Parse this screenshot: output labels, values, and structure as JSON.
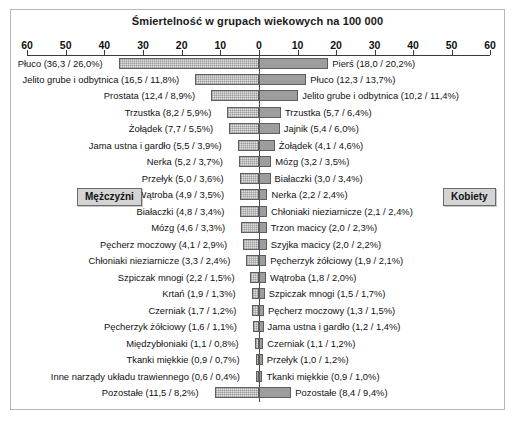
{
  "chart": {
    "title": "Śmiertelność w grupach wiekowych na 100 000",
    "legend_men": "Mężczyźni",
    "legend_women": "Kobiety",
    "colors": {
      "bar_men_fill": "#e2e2e2",
      "bar_women_fill": "#9d9d9d",
      "bar_border": "#5d5d5d",
      "frame_border": "#b8b8b8",
      "axis": "#3a3a3a",
      "legend_bg": "#d4d4d4",
      "text": "#111111"
    }
  },
  "chart_data": {
    "type": "bar",
    "title": "Śmiertelność w grupach wiekowych na 100 000",
    "subtitle": "",
    "xlabel": "",
    "ylabel": "",
    "orientation": "horizontal",
    "layout": "diverging-bidirectional-pyramid",
    "grid": false,
    "legend_position": "inside-middle-left-and-right",
    "axis": {
      "left_ticks": [
        60,
        50,
        40,
        30,
        20,
        10,
        0
      ],
      "right_ticks": [
        0,
        10,
        20,
        30,
        40,
        50,
        60
      ],
      "tick_labels_left": [
        "60",
        "50",
        "40",
        "30",
        "20",
        "10",
        "0"
      ],
      "tick_labels_right": [
        "0",
        "10",
        "20",
        "30",
        "40",
        "50",
        "60"
      ],
      "xlim_left": [
        0,
        60
      ],
      "xlim_right": [
        0,
        60
      ],
      "center_value": 0
    },
    "series": [
      {
        "name": "Mężczyźni",
        "side": "left",
        "value_unit": "rate per 100 000",
        "items": [
          {
            "label": "Płuco",
            "value": 36.3,
            "percent": 26.0,
            "text": "Płuco (36,3 / 26,0%)"
          },
          {
            "label": "Jelito grube i odbytnica",
            "value": 16.5,
            "percent": 11.8,
            "text": "Jelito grube i odbytnica (16,5 / 11,8%)"
          },
          {
            "label": "Prostata",
            "value": 12.4,
            "percent": 8.9,
            "text": "Prostata (12,4 / 8,9%)"
          },
          {
            "label": "Trzustka",
            "value": 8.2,
            "percent": 5.9,
            "text": "Trzustka (8,2 / 5,9%)"
          },
          {
            "label": "Żołądek",
            "value": 7.7,
            "percent": 5.5,
            "text": "Żołądek (7,7 / 5,5%)"
          },
          {
            "label": "Jama ustna i gardło",
            "value": 5.5,
            "percent": 3.9,
            "text": "Jama ustna i gardło (5,5 / 3,9%)"
          },
          {
            "label": "Nerka",
            "value": 5.2,
            "percent": 3.7,
            "text": "Nerka (5,2 / 3,7%)"
          },
          {
            "label": "Przełyk",
            "value": 5.0,
            "percent": 3.6,
            "text": "Przełyk (5,0 / 3,6%)"
          },
          {
            "label": "Wątroba",
            "value": 4.9,
            "percent": 3.5,
            "text": "Wątroba (4,9 / 3,5%)"
          },
          {
            "label": "Białaczki",
            "value": 4.8,
            "percent": 3.4,
            "text": "Białaczki (4,8 / 3,4%)"
          },
          {
            "label": "Mózg",
            "value": 4.6,
            "percent": 3.3,
            "text": "Mózg (4,6 / 3,3%)"
          },
          {
            "label": "Pęcherz moczowy",
            "value": 4.1,
            "percent": 2.9,
            "text": "Pęcherz moczowy (4,1 / 2,9%)"
          },
          {
            "label": "Chłoniaki nieziarnicze",
            "value": 3.3,
            "percent": 2.4,
            "text": "Chłoniaki nieziarnicze (3,3 / 2,4%)"
          },
          {
            "label": "Szpiczak mnogi",
            "value": 2.2,
            "percent": 1.5,
            "text": "Szpiczak mnogi (2,2 / 1,5%)"
          },
          {
            "label": "Krtań",
            "value": 1.9,
            "percent": 1.3,
            "text": "Krtań (1,9 / 1,3%)"
          },
          {
            "label": "Czerniak",
            "value": 1.7,
            "percent": 1.2,
            "text": "Czerniak (1,7 / 1,2%)"
          },
          {
            "label": "Pęcherzyk żółciowy",
            "value": 1.6,
            "percent": 1.1,
            "text": "Pęcherzyk żółciowy (1,6 / 1,1%)"
          },
          {
            "label": "Międzybłoniaki",
            "value": 1.1,
            "percent": 0.8,
            "text": "Międzybłoniaki (1,1 / 0,8%)"
          },
          {
            "label": "Tkanki miękkie",
            "value": 0.9,
            "percent": 0.7,
            "text": "Tkanki miękkie (0,9 / 0,7%)"
          },
          {
            "label": "Inne narządy układu trawiennego",
            "value": 0.6,
            "percent": 0.4,
            "text": "Inne narządy układu trawiennego (0,6 / 0,4%)"
          },
          {
            "label": "Pozostałe",
            "value": 11.5,
            "percent": 8.2,
            "text": "Pozostałe (11,5 / 8,2%)"
          }
        ]
      },
      {
        "name": "Kobiety",
        "side": "right",
        "value_unit": "rate per 100 000",
        "items": [
          {
            "label": "Pierś",
            "value": 18.0,
            "percent": 20.2,
            "text": "Pierś (18,0 / 20,2%)"
          },
          {
            "label": "Płuco",
            "value": 12.3,
            "percent": 13.7,
            "text": "Płuco (12,3 / 13,7%)"
          },
          {
            "label": "Jelito grube i odbytnica",
            "value": 10.2,
            "percent": 11.4,
            "text": "Jelito grube i odbytnica (10,2 / 11,4%)"
          },
          {
            "label": "Trzustka",
            "value": 5.7,
            "percent": 6.4,
            "text": "Trzustka (5,7 / 6,4%)"
          },
          {
            "label": "Jajnik",
            "value": 5.4,
            "percent": 6.0,
            "text": "Jajnik (5,4 / 6,0%)"
          },
          {
            "label": "Żołądek",
            "value": 4.1,
            "percent": 4.6,
            "text": "Żołądek (4,1 / 4,6%)"
          },
          {
            "label": "Mózg",
            "value": 3.2,
            "percent": 3.5,
            "text": "Mózg (3,2 / 3,5%)"
          },
          {
            "label": "Białaczki",
            "value": 3.0,
            "percent": 3.4,
            "text": "Białaczki (3,0 / 3,4%)"
          },
          {
            "label": "Nerka",
            "value": 2.2,
            "percent": 2.4,
            "text": "Nerka (2,2 / 2,4%)"
          },
          {
            "label": "Chłoniaki nieziarnicze",
            "value": 2.1,
            "percent": 2.4,
            "text": "Chłoniaki nieziarnicze (2,1 / 2,4%)"
          },
          {
            "label": "Trzon macicy",
            "value": 2.0,
            "percent": 2.3,
            "text": "Trzon macicy (2,0 / 2,3%)"
          },
          {
            "label": "Szyjka macicy",
            "value": 2.0,
            "percent": 2.2,
            "text": "Szyjka macicy (2,0 / 2,2%)"
          },
          {
            "label": "Pęcherzyk żółciowy",
            "value": 1.9,
            "percent": 2.1,
            "text": "Pęcherzyk żółciowy (1,9 / 2,1%)"
          },
          {
            "label": "Wątroba",
            "value": 1.8,
            "percent": 2.0,
            "text": "Wątroba (1,8 / 2,0%)"
          },
          {
            "label": "Szpiczak mnogi",
            "value": 1.5,
            "percent": 1.7,
            "text": "Szpiczak mnogi (1,5 / 1,7%)"
          },
          {
            "label": "Pęcherz moczowy",
            "value": 1.3,
            "percent": 1.5,
            "text": "Pęcherz moczowy (1,3 / 1,5%)"
          },
          {
            "label": "Jama ustna i gardło",
            "value": 1.2,
            "percent": 1.4,
            "text": "Jama ustna i gardło (1,2 / 1,4%)"
          },
          {
            "label": "Czerniak",
            "value": 1.1,
            "percent": 1.2,
            "text": "Czerniak (1,1 / 1,2%)"
          },
          {
            "label": "Przełyk",
            "value": 1.0,
            "percent": 1.2,
            "text": "Przełyk (1,0 / 1,2%)"
          },
          {
            "label": "Tkanki miękkie",
            "value": 0.9,
            "percent": 1.0,
            "text": "Tkanki miękkie (0,9 / 1,0%)"
          },
          {
            "label": "Pozostałe",
            "value": 8.4,
            "percent": 9.4,
            "text": "Pozostałe (8,4 / 9,4%)"
          }
        ]
      }
    ]
  }
}
